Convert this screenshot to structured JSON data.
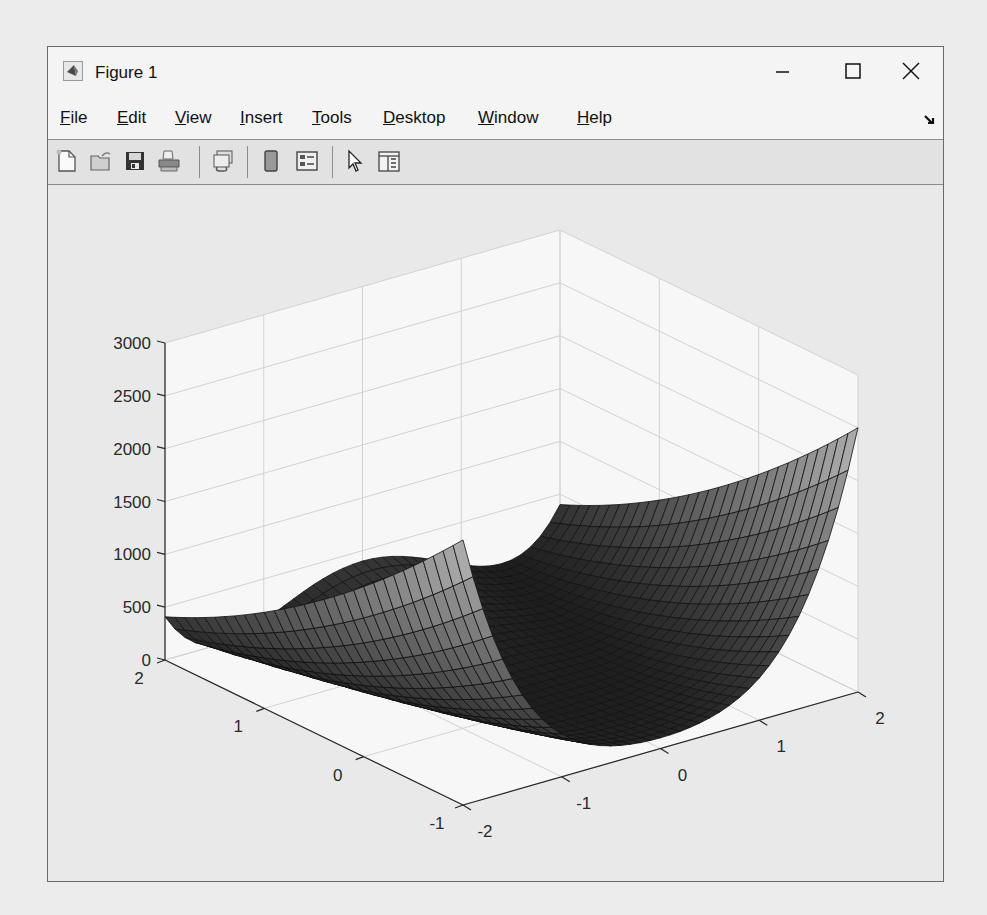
{
  "window": {
    "title": "Figure 1",
    "controls": {
      "minimize": "minimize",
      "maximize": "maximize",
      "close": "close"
    }
  },
  "menubar": {
    "items": [
      {
        "label_u": "F",
        "label_rest": "ile"
      },
      {
        "label_u": "E",
        "label_rest": "dit"
      },
      {
        "label_u": "V",
        "label_rest": "iew"
      },
      {
        "label_u": "I",
        "label_rest": "nsert"
      },
      {
        "label_u": "T",
        "label_rest": "ools"
      },
      {
        "label_u": "D",
        "label_rest": "esktop"
      },
      {
        "label_u": "W",
        "label_rest": "indow"
      },
      {
        "label_u": "H",
        "label_rest": "elp"
      }
    ]
  },
  "toolbar": {
    "buttons": [
      "new-figure-icon",
      "open-file-icon",
      "save-icon",
      "print-icon",
      "link-plot-icon",
      "colorbar-icon",
      "legend-icon",
      "edit-plot-pointer-icon",
      "property-inspector-icon"
    ]
  },
  "chart_data": {
    "type": "surface",
    "function": "Rosenbrock: z = (1 - x)^2 + 100*(y - x^2)^2",
    "x": {
      "range": [
        -2,
        2
      ],
      "ticks": [
        -2,
        -1,
        0,
        1,
        2
      ],
      "tick_labels": [
        "-2",
        "-1",
        "0",
        "1",
        "2"
      ]
    },
    "y": {
      "range": [
        -1,
        2
      ],
      "ticks": [
        -1,
        0,
        1,
        2
      ],
      "tick_labels": [
        "-1",
        "0",
        "1",
        "2"
      ]
    },
    "z": {
      "range": [
        0,
        3000
      ],
      "ticks": [
        0,
        500,
        1000,
        1500,
        2000,
        2500,
        3000
      ],
      "tick_labels": [
        "0",
        "500",
        "1000",
        "1500",
        "2000",
        "2500",
        "3000"
      ]
    },
    "grid_resolution": {
      "nx": 41,
      "ny": 31
    },
    "corner_values": {
      "x=-2,y=-1": 2509,
      "x=2,y=-1": 2501,
      "x=-2,y=2": 409,
      "x=2,y=2": 401
    },
    "colormap": "gray",
    "grid": true,
    "title": "",
    "xlabel": "",
    "ylabel": "",
    "zlabel": ""
  }
}
